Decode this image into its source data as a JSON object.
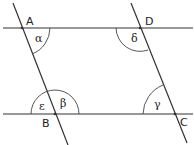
{
  "diagram": {
    "type": "geometry",
    "points": {
      "A": {
        "label": "A",
        "x": 22,
        "y": 28
      },
      "B": {
        "label": "B",
        "x": 55,
        "y": 114
      },
      "C": {
        "label": "C",
        "x": 175,
        "y": 114
      },
      "D": {
        "label": "D",
        "x": 140,
        "y": 28
      }
    },
    "angles": {
      "alpha": {
        "label": "α",
        "at": "A"
      },
      "beta": {
        "label": "β",
        "at": "B"
      },
      "gamma": {
        "label": "γ",
        "at": "C"
      },
      "delta": {
        "label": "δ",
        "at": "D"
      },
      "epsilon": {
        "label": "ε",
        "at": "B"
      }
    },
    "colors": {
      "line": "#333333",
      "background": "#ffffff"
    }
  }
}
